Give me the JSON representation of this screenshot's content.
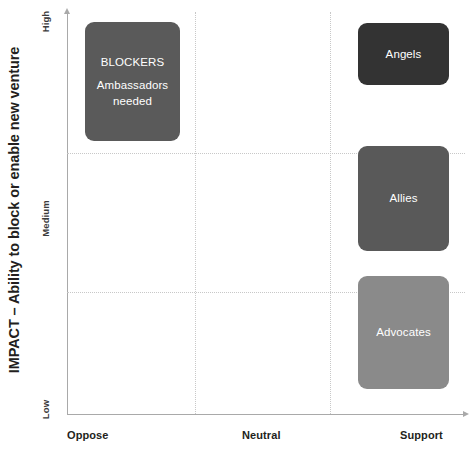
{
  "chart_data": {
    "type": "scatter",
    "title": "",
    "ylabel": "IMPACT – Ability to block or enable new venture",
    "xlabel": "",
    "x_tick_labels": [
      "Oppose",
      "Neutral",
      "Support"
    ],
    "y_tick_labels": [
      "High",
      "Medium",
      "Low"
    ],
    "grid": true,
    "legend": "none",
    "xlim": [
      "Oppose",
      "Support"
    ],
    "ylim": [
      "Low",
      "High"
    ],
    "items": [
      {
        "key": "blockers",
        "label": "BLOCKERS",
        "sublabel": "Ambassadors\nneeded",
        "sublabel_line1": "Ambassadors",
        "sublabel_line2": "needed",
        "x_band": "Oppose",
        "y_band": "High",
        "color": "#5a5a5a",
        "text_color": "#ffffff"
      },
      {
        "key": "angels",
        "label": "Angels",
        "x_band": "Support",
        "y_band": "High",
        "color": "#333333",
        "text_color": "#ffffff"
      },
      {
        "key": "allies",
        "label": "Allies",
        "x_band": "Support",
        "y_band": "Medium",
        "color": "#595959",
        "text_color": "#ffffff"
      },
      {
        "key": "advocates",
        "label": "Advocates",
        "x_band": "Support",
        "y_band": "Low",
        "color": "#8a8a8a",
        "text_color": "#ffffff"
      }
    ]
  },
  "axes": {
    "y_title": "IMPACT – Ability to block or enable new venture",
    "y_ticks": {
      "high": "High",
      "medium": "Medium",
      "low": "Low"
    },
    "x_ticks": {
      "oppose": "Oppose",
      "neutral": "Neutral",
      "support": "Support"
    }
  },
  "boxes": {
    "blockers": {
      "label": "BLOCKERS",
      "sublabel_line1": "Ambassadors",
      "sublabel_line2": "needed"
    },
    "angels": {
      "label": "Angels"
    },
    "allies": {
      "label": "Allies"
    },
    "advocates": {
      "label": "Advocates"
    }
  },
  "colors": {
    "blockers": "#5a5a5a",
    "angels": "#333333",
    "allies": "#595959",
    "advocates": "#8a8a8a",
    "axis": "#a9a9a9",
    "grid": "#c8c8c8",
    "text": "#231f20",
    "background": "#ffffff"
  }
}
